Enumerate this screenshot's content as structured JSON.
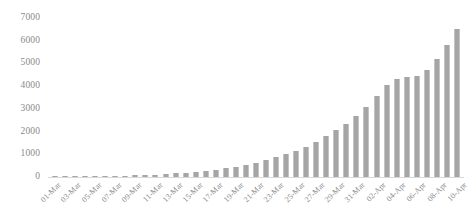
{
  "chart_data": {
    "type": "bar",
    "title": "",
    "xlabel": "",
    "ylabel": "",
    "ylim": [
      0,
      7000
    ],
    "ytick_interval": 1000,
    "yticks": [
      "7000",
      "6000",
      "5000",
      "4000",
      "3000",
      "2000",
      "1000",
      "0"
    ],
    "ytick_values": [
      7000,
      6000,
      5000,
      4000,
      3000,
      2000,
      1000,
      0
    ],
    "grid": false,
    "legend": null,
    "legend_position": "none",
    "bar_color": "#a5a5a5",
    "axis_color": "#d9d9d9",
    "text_color": "#8a8a8a",
    "xtick_rotation": -45,
    "xtick_step": 2,
    "categories": [
      "01-Mar",
      "02-Mar",
      "03-Mar",
      "04-Mar",
      "05-Mar",
      "06-Mar",
      "07-Mar",
      "08-Mar",
      "09-Mar",
      "10-Mar",
      "11-Mar",
      "12-Mar",
      "13-Mar",
      "14-Mar",
      "15-Mar",
      "16-Mar",
      "17-Mar",
      "18-Mar",
      "19-Mar",
      "20-Mar",
      "21-Mar",
      "22-Mar",
      "23-Mar",
      "24-Mar",
      "25-Mar",
      "26-Mar",
      "27-Mar",
      "28-Mar",
      "29-Mar",
      "30-Mar",
      "31-Mar",
      "01-Apr",
      "02-Apr",
      "03-Apr",
      "04-Apr",
      "05-Apr",
      "06-Apr",
      "07-Apr",
      "08-Apr",
      "09-Apr",
      "10-Apr"
    ],
    "xtick_labels": [
      "01-Mar",
      "03-Mar",
      "05-Mar",
      "07-Mar",
      "09-Mar",
      "11-Mar",
      "13-Mar",
      "15-Mar",
      "17-Mar",
      "19-Mar",
      "21-Mar",
      "23-Mar",
      "25-Mar",
      "27-Mar",
      "29-Mar",
      "31-Mar",
      "02-Apr",
      "04-Apr",
      "06-Apr",
      "08-Apr",
      "10-Apr"
    ],
    "values": [
      5,
      10,
      15,
      20,
      28,
      35,
      45,
      58,
      70,
      85,
      100,
      125,
      155,
      190,
      230,
      275,
      330,
      390,
      460,
      540,
      630,
      740,
      860,
      1000,
      1160,
      1340,
      1550,
      1790,
      2050,
      2350,
      2700,
      3100,
      3550,
      4050,
      4300,
      4400,
      4450,
      4700,
      5200,
      5800,
      6500
    ]
  }
}
